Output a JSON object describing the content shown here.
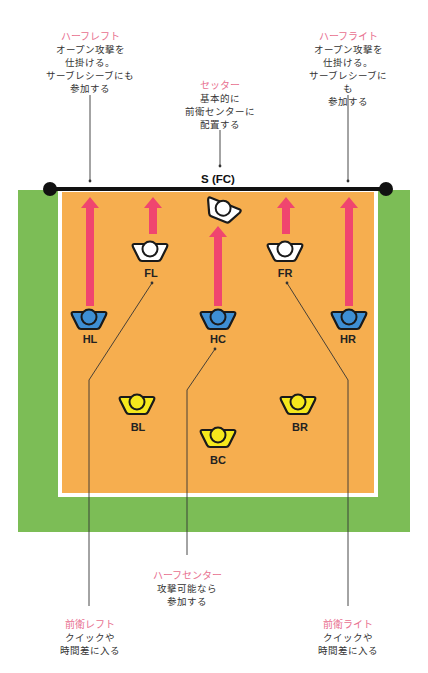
{
  "colors": {
    "field": "#7cbd56",
    "court": "#f6ae4f",
    "court_line": "#ffffff",
    "net": "#111111",
    "arrow": "#f0456f",
    "front_player": "#ffffff",
    "half_player": "#3e8fd4",
    "back_player": "#f5e81c",
    "callout_title": "#e8708f",
    "callout_text": "#333333"
  },
  "net": {
    "label": "S (FC)"
  },
  "players": [
    {
      "id": "S",
      "label": "",
      "row": "setter"
    },
    {
      "id": "FL",
      "label": "FL",
      "row": "front"
    },
    {
      "id": "FR",
      "label": "FR",
      "row": "front"
    },
    {
      "id": "HL",
      "label": "HL",
      "row": "half"
    },
    {
      "id": "HC",
      "label": "HC",
      "row": "half"
    },
    {
      "id": "HR",
      "label": "HR",
      "row": "half"
    },
    {
      "id": "BL",
      "label": "BL",
      "row": "back"
    },
    {
      "id": "BC",
      "label": "BC",
      "row": "back"
    },
    {
      "id": "BR",
      "label": "BR",
      "row": "back"
    }
  ],
  "callouts": {
    "half_left": {
      "title": "ハーフレフト",
      "text": "オープン攻撃を\n仕掛ける。\nサーブレシーブにも\n参加する"
    },
    "setter": {
      "title": "セッター",
      "text": "基本的に\n前衛センターに\n配置する"
    },
    "half_right": {
      "title": "ハーフライト",
      "text": "オープン攻撃を\n仕掛ける。\nサーブレシーブにも\n参加する"
    },
    "half_center": {
      "title": "ハーフセンター",
      "text": "攻撃可能なら\n参加する"
    },
    "front_left": {
      "title": "前衛レフト",
      "text": "クイックや\n時間差に入る"
    },
    "front_right": {
      "title": "前衛ライト",
      "text": "クイックや\n時間差に入る"
    }
  }
}
